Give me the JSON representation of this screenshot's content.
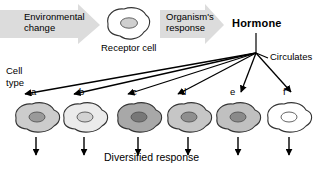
{
  "diagram": {
    "title_text": "Diversified response",
    "block_arrows": [
      {
        "id": "environmental-change",
        "label": "Environmental\nchange",
        "x": 0,
        "y": 6,
        "w": 100,
        "h": 38,
        "fill": "#dcdcdc"
      },
      {
        "id": "organisms-response",
        "label": "Organism's\nresponse",
        "x": 160,
        "y": 6,
        "w": 62,
        "h": 38,
        "fill": "#dcdcdc"
      }
    ],
    "hormone": {
      "label": "Hormone",
      "x": 232,
      "y": 20
    },
    "circulates": {
      "label": "Circulates",
      "x": 270,
      "y": 53
    },
    "receptor_cell": {
      "label": "Receptor cell",
      "label_x": 101,
      "label_y": 45,
      "cx": 128,
      "cy": 24,
      "body_fill": "#ffffff",
      "nucleus_fill": "#cfcfcf"
    },
    "cell_type_label": {
      "line1": "Cell",
      "line2": "type",
      "x": 6,
      "y": 72
    },
    "hub": {
      "x": 256,
      "y": 53
    },
    "cells": [
      {
        "letter": "a",
        "cx": 40,
        "cy": 118,
        "body_fill": "#cccccc",
        "nucleus_fill": "#9a9a9a",
        "letter_x": 31,
        "letter_y": 92,
        "arrow_tip_x": 23,
        "arrow_tip_y": 95
      },
      {
        "letter": "b",
        "cx": 88,
        "cy": 118,
        "body_fill": "#ebebeb",
        "nucleus_fill": "#d2d2d2",
        "letter_x": 79,
        "letter_y": 92,
        "arrow_tip_x": 72,
        "arrow_tip_y": 95
      },
      {
        "letter": "c",
        "cx": 142,
        "cy": 118,
        "body_fill": "#a8a8a8",
        "nucleus_fill": "#787878",
        "letter_x": 132,
        "letter_y": 92,
        "arrow_tip_x": 126,
        "arrow_tip_y": 95
      },
      {
        "letter": "d",
        "cx": 192,
        "cy": 118,
        "body_fill": "#c6c6c6",
        "nucleus_fill": "#8f8f8f",
        "letter_x": 181,
        "letter_y": 92,
        "arrow_tip_x": 176,
        "arrow_tip_y": 95
      },
      {
        "letter": "e",
        "cx": 241,
        "cy": 118,
        "body_fill": "#c0c0c0",
        "nucleus_fill": "#8a8a8a",
        "letter_x": 230,
        "letter_y": 92,
        "arrow_tip_x": 240,
        "arrow_tip_y": 95
      },
      {
        "letter": "f",
        "cx": 292,
        "cy": 118,
        "body_fill": "#ffffff",
        "nucleus_fill": "#ffffff",
        "letter_x": 283,
        "letter_y": 92,
        "arrow_tip_x": 289,
        "arrow_tip_y": 95
      }
    ],
    "down_arrows_y_start": 137,
    "down_arrows_y_end": 156,
    "bottom_label": {
      "text": "Diversified response",
      "x": 104,
      "y": 155
    },
    "colors": {
      "line": "#000000",
      "block_arrow_fill": "#dcdcdc",
      "cell_outline": "#333333",
      "background": "#ffffff"
    }
  }
}
